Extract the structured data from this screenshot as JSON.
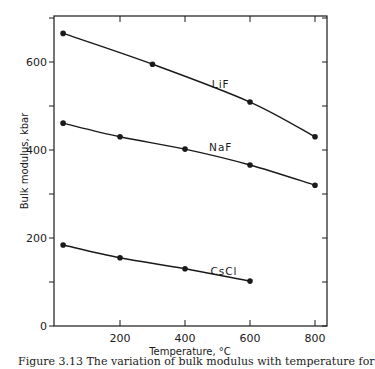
{
  "chart_data": {
    "type": "line",
    "title": "",
    "xlabel": "Temperature, °C",
    "ylabel": "Bulk modulus, kbar",
    "xlim": [
      0,
      825
    ],
    "ylim": [
      0,
      700
    ],
    "x_ticks": [
      200,
      400,
      600,
      800
    ],
    "x_tick_labels": [
      "200",
      "400",
      "600",
      "800"
    ],
    "y_ticks": [
      0,
      200,
      400,
      600
    ],
    "y_tick_labels": [
      "0",
      "200",
      "400",
      "600"
    ],
    "y_minor_ticks": [
      100,
      300,
      500,
      700
    ],
    "grid": false,
    "legend": "inline labels",
    "series": [
      {
        "name": "LiF",
        "label_pos": [
          510,
          540
        ],
        "x": [
          25,
          300,
          600,
          800
        ],
        "y": [
          665,
          595,
          509,
          430
        ]
      },
      {
        "name": "NaF",
        "label_pos": [
          510,
          398
        ],
        "x": [
          25,
          200,
          400,
          600,
          800
        ],
        "y": [
          461,
          430,
          402,
          366,
          320
        ]
      },
      {
        "name": "CsCl",
        "label_pos": [
          520,
          115
        ],
        "x": [
          25,
          200,
          400,
          600
        ],
        "y": [
          184,
          155,
          130,
          102
        ]
      }
    ]
  },
  "caption": {
    "text": "Figure 3.13  The variation of bulk modulus with temperature for"
  }
}
